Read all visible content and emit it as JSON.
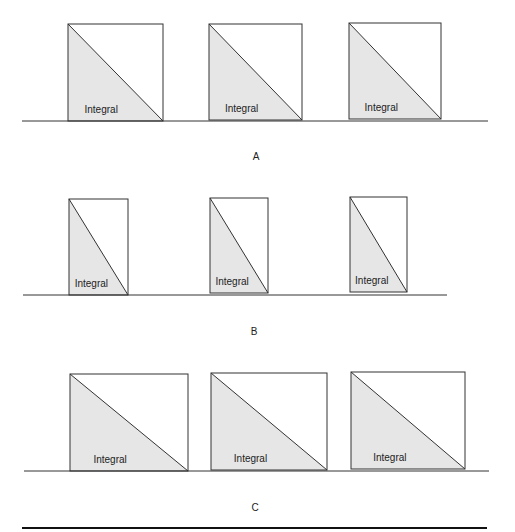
{
  "colors": {
    "fill": "#e6e6e6",
    "stroke": "#333333",
    "background": "#ffffff"
  },
  "panels": [
    {
      "label": "A",
      "baseline": {
        "x1": 22,
        "x2": 488,
        "y": 121
      },
      "label_pos": {
        "x": 256,
        "y": 151
      },
      "boxes": [
        {
          "x": 68,
          "y": 24,
          "w": 95,
          "h": 97,
          "text": "Integral"
        },
        {
          "x": 209,
          "y": 24,
          "w": 93,
          "h": 96,
          "text": "Integral"
        },
        {
          "x": 349,
          "y": 23,
          "w": 92,
          "h": 96,
          "text": "Integral"
        }
      ]
    },
    {
      "label": "B",
      "baseline": {
        "x1": 23,
        "x2": 447,
        "y": 295
      },
      "label_pos": {
        "x": 254,
        "y": 326
      },
      "boxes": [
        {
          "x": 69,
          "y": 199,
          "w": 59,
          "h": 96,
          "text": "Integral"
        },
        {
          "x": 210,
          "y": 198,
          "w": 58,
          "h": 95,
          "text": "Integral"
        },
        {
          "x": 350,
          "y": 197,
          "w": 57,
          "h": 95,
          "text": "Integral"
        }
      ]
    },
    {
      "label": "C",
      "baseline": {
        "x1": 24,
        "x2": 489,
        "y": 471
      },
      "label_pos": {
        "x": 255,
        "y": 502
      },
      "boxes": [
        {
          "x": 70,
          "y": 374,
          "w": 118,
          "h": 97,
          "text": "Integral"
        },
        {
          "x": 211,
          "y": 373,
          "w": 116,
          "h": 97,
          "text": "Integral"
        },
        {
          "x": 351,
          "y": 372,
          "w": 114,
          "h": 97,
          "text": "Integral"
        }
      ]
    }
  ],
  "bottom_rule": {
    "x1": 22,
    "x2": 487,
    "y": 528
  }
}
